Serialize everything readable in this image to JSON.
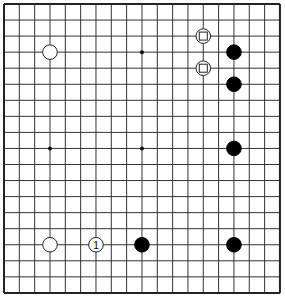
{
  "board": {
    "size": 19,
    "origin_x": 4,
    "origin_y": 4,
    "spacing_x": 15.33,
    "spacing_y": 16.05,
    "line_color": "#333333",
    "border_color": "#222222",
    "background": "#ffffff",
    "star_points": [
      [
        3,
        3
      ],
      [
        9,
        3
      ],
      [
        15,
        3
      ],
      [
        3,
        9
      ],
      [
        9,
        9
      ],
      [
        15,
        9
      ],
      [
        3,
        15
      ],
      [
        9,
        15
      ],
      [
        15,
        15
      ]
    ]
  },
  "stones": [
    {
      "color": "white",
      "col": 3,
      "row": 3,
      "marker": ""
    },
    {
      "color": "white",
      "col": 13,
      "row": 2,
      "marker": "square"
    },
    {
      "color": "white",
      "col": 13,
      "row": 4,
      "marker": "square"
    },
    {
      "color": "black",
      "col": 15,
      "row": 3,
      "marker": ""
    },
    {
      "color": "black",
      "col": 15,
      "row": 5,
      "marker": ""
    },
    {
      "color": "black",
      "col": 15,
      "row": 9,
      "marker": ""
    },
    {
      "color": "white",
      "col": 3,
      "row": 15,
      "marker": ""
    },
    {
      "color": "white",
      "col": 6,
      "row": 15,
      "marker": "",
      "label": "1"
    },
    {
      "color": "black",
      "col": 9,
      "row": 15,
      "marker": ""
    },
    {
      "color": "black",
      "col": 15,
      "row": 15,
      "marker": ""
    }
  ]
}
